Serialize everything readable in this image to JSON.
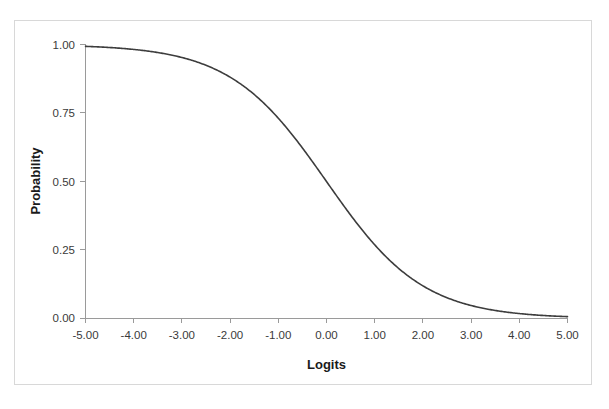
{
  "figure": {
    "background_color": "#ffffff",
    "border_color": "#d8d8d8",
    "axis_color": "#9a9a9a",
    "curve_color": "#3d3d3d"
  },
  "chart_data": {
    "type": "line",
    "title": "",
    "subtitle": "",
    "xlabel": "Logits",
    "ylabel": "Probability",
    "xlim": [
      -5,
      5
    ],
    "ylim": [
      0,
      1
    ],
    "grid": false,
    "legend": null,
    "legend_position": "none",
    "x_tick_labels": [
      "-5.00",
      "-4.00",
      "-3.00",
      "-2.00",
      "-1.00",
      "0.00",
      "1.00",
      "2.00",
      "3.00",
      "4.00",
      "5.00"
    ],
    "x_tick_values": [
      -5,
      -4,
      -3,
      -2,
      -1,
      0,
      1,
      2,
      3,
      4,
      5
    ],
    "y_tick_labels": [
      "0.00",
      "0.25",
      "0.50",
      "0.75",
      "1.00"
    ],
    "y_tick_values": [
      0,
      0.25,
      0.5,
      0.75,
      1
    ],
    "series": [
      {
        "name": "Logistic probability",
        "formula": "P = 1 / (1 + exp(x))",
        "x": [
          -5,
          -4.5,
          -4,
          -3.5,
          -3,
          -2.5,
          -2,
          -1.5,
          -1,
          -0.5,
          0,
          0.5,
          1,
          1.5,
          2,
          2.5,
          3,
          3.5,
          4,
          4.5,
          5
        ],
        "values": [
          0.993,
          0.989,
          0.982,
          0.971,
          0.953,
          0.924,
          0.881,
          0.818,
          0.731,
          0.622,
          0.5,
          0.378,
          0.269,
          0.182,
          0.119,
          0.076,
          0.047,
          0.029,
          0.018,
          0.011,
          0.007
        ]
      }
    ],
    "annotations": []
  }
}
